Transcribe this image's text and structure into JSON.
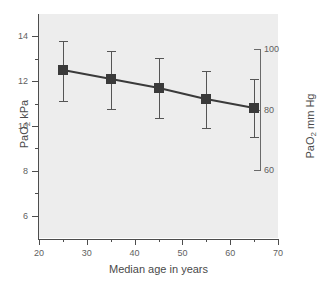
{
  "chart_data": {
    "type": "scatter",
    "title": "",
    "xlabel": "Median age in years",
    "ylabel": "PaO2 kPa",
    "ylabel_right": "PaO2 mm Hg",
    "xlim": [
      20,
      70
    ],
    "ylim": [
      5,
      15
    ],
    "ylim_right": [
      60,
      100
    ],
    "grid": false,
    "legend": "none",
    "x": [
      25,
      35,
      45,
      55,
      65
    ],
    "values": [
      12.5,
      12.1,
      11.7,
      11.2,
      10.8
    ],
    "err_low": [
      11.1,
      10.75,
      10.35,
      9.9,
      9.5
    ],
    "err_high": [
      13.8,
      13.35,
      13.05,
      12.45,
      12.1
    ],
    "series": [
      {
        "name": "PaO2 by median age",
        "values": [
          12.5,
          12.1,
          11.7,
          11.2,
          10.8
        ]
      }
    ],
    "xticks": [
      20,
      30,
      40,
      50,
      60,
      70
    ],
    "xtick_labels": [
      "20",
      "30",
      "40",
      "50",
      "60",
      "70"
    ],
    "yticks": [
      6,
      8,
      10,
      12,
      14
    ],
    "ytick_labels": [
      "6",
      "8",
      "10",
      "12",
      "14"
    ],
    "yticks_minor": [
      7,
      9,
      11,
      13
    ],
    "yticks_right": [
      60,
      80,
      100
    ],
    "ytick_labels_right": [
      "60",
      "80",
      "100"
    ],
    "marker": "filled-square",
    "marker_color": "#3a3a3a",
    "line_color": "#3a3a3a",
    "errorbar_color": "#555555",
    "plot_background": "#ededed",
    "axis_color": "#4d4d4d"
  },
  "axis_titles": {
    "left_prefix": "PaO",
    "left_sub": "2",
    "left_suffix": " kPa",
    "right_prefix": "PaO",
    "right_sub": "2",
    "right_suffix": " mm Hg",
    "bottom": "Median age in years"
  }
}
